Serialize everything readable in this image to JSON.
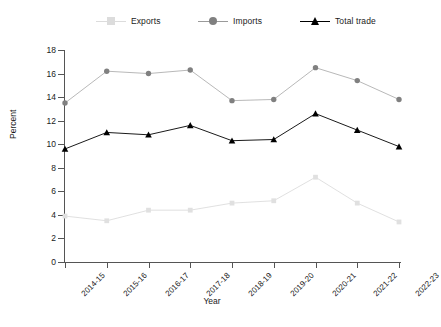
{
  "chart_data": {
    "type": "line",
    "title": "",
    "xlabel": "Year",
    "ylabel": "Percent",
    "ylim": [
      0,
      18
    ],
    "yticks": [
      0,
      2,
      4,
      6,
      8,
      10,
      12,
      14,
      16,
      18
    ],
    "grid": false,
    "legend_position": "top",
    "categories": [
      "2014-15",
      "2015-16",
      "2016-17",
      "2017-18",
      "2018-19",
      "2019-20",
      "2020-21",
      "2021-22",
      "2022-23"
    ],
    "series": [
      {
        "name": "Exports",
        "color": "#dcdcdc",
        "marker": "square",
        "values": [
          3.9,
          3.5,
          4.4,
          4.4,
          5.0,
          5.2,
          7.2,
          5.0,
          3.4
        ]
      },
      {
        "name": "Imports",
        "color": "#808080",
        "marker": "circle",
        "values": [
          13.5,
          16.2,
          16.0,
          16.3,
          13.7,
          13.8,
          16.5,
          15.4,
          13.8
        ]
      },
      {
        "name": "Total trade",
        "color": "#000000",
        "marker": "triangle",
        "values": [
          9.6,
          11.0,
          10.8,
          11.6,
          10.3,
          10.4,
          12.6,
          11.2,
          9.8
        ]
      }
    ]
  },
  "legend": {
    "items": [
      {
        "label": "Exports"
      },
      {
        "label": "Imports"
      },
      {
        "label": "Total trade"
      }
    ]
  },
  "axes": {
    "y_title": "Percent",
    "x_title": "Year"
  }
}
